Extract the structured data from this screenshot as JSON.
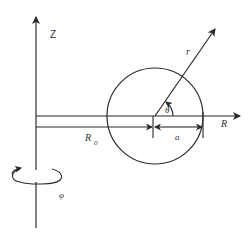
{
  "figure": {
    "type": "toroidal coordinate schematic",
    "colors": {
      "line": "#2b2b2b",
      "text": "#333333",
      "background": "#ffffff"
    }
  },
  "labels": {
    "z_axis": "Z",
    "r_axis": "R",
    "radial_coordinate": "r",
    "poloidal_angle": "θ",
    "major_radius": "R",
    "major_radius_subscript": "0",
    "minor_radius": "a",
    "toroidal_angle": "φ"
  }
}
